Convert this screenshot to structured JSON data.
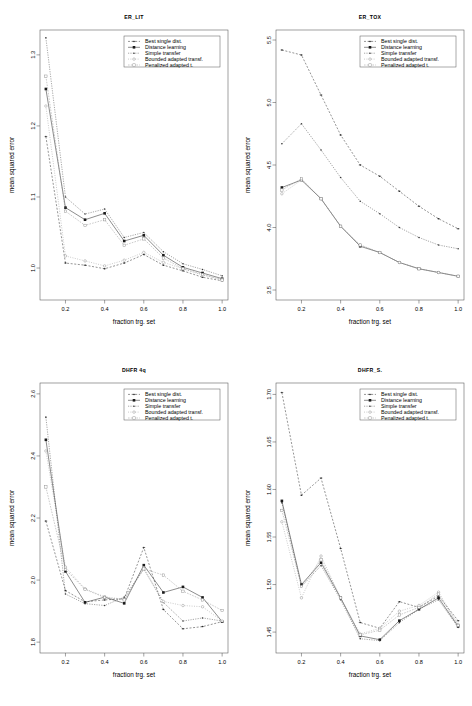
{
  "figure": {
    "name": "four-panel-mse-vs-fraction-training-set",
    "panel_count": 4
  },
  "common": {
    "xlabel": "fraction trg. set",
    "ylabel": "mean squared error",
    "xticks": [
      "0.2",
      "0.4",
      "0.6",
      "0.8",
      "1.0"
    ],
    "xtick_values": [
      0.2,
      0.4,
      0.6,
      0.8,
      1.0
    ],
    "xlim": [
      0.07,
      1.03
    ],
    "legend_labels": [
      "Best single dist.",
      "Distance learning",
      "Simple transfer",
      "Bounded adapted transf.",
      "Penalized adapted t."
    ],
    "legend_markers": [
      "dot-cross",
      "filled-square",
      "dot-small",
      "open-circle",
      "open-square"
    ],
    "legend_position": "top-right inside plot",
    "grid": false
  },
  "chart_data": [
    {
      "type": "line",
      "title": "ER_LIT",
      "xlabel": "fraction trg. set",
      "ylabel": "mean squared error",
      "x": [
        0.1,
        0.2,
        0.3,
        0.4,
        0.5,
        0.6,
        0.7,
        0.8,
        0.9,
        1.0
      ],
      "xlim": [
        0.07,
        1.03
      ],
      "ylim": [
        0.955,
        1.335
      ],
      "yticks": [
        "1.0",
        "1.1",
        "1.2",
        "1.3"
      ],
      "ytick_values": [
        1.0,
        1.1,
        1.2,
        1.3
      ],
      "series": [
        {
          "name": "Best single dist.",
          "values": [
            1.185,
            1.007,
            1.004,
            0.999,
            1.007,
            1.019,
            1.004,
            0.996,
            0.987,
            0.982
          ]
        },
        {
          "name": "Distance learning",
          "values": [
            1.252,
            1.085,
            1.068,
            1.077,
            1.038,
            1.046,
            1.018,
            1.001,
            0.993,
            0.985
          ]
        },
        {
          "name": "Simple transfer",
          "values": [
            1.324,
            1.1,
            1.076,
            1.083,
            1.043,
            1.05,
            1.023,
            1.006,
            0.998,
            0.989
          ]
        },
        {
          "name": "Bounded adapted transf.",
          "values": [
            1.228,
            1.017,
            1.01,
            1.003,
            1.011,
            1.022,
            1.008,
            0.999,
            0.99,
            0.984
          ]
        },
        {
          "name": "Penalized adapted t.",
          "values": [
            1.27,
            1.08,
            1.06,
            1.068,
            1.032,
            1.041,
            1.014,
            0.999,
            0.991,
            0.983
          ]
        }
      ]
    },
    {
      "type": "line",
      "title": "ER_TOX",
      "xlabel": "fraction trg. set",
      "ylabel": "mean squared error",
      "x": [
        0.1,
        0.2,
        0.3,
        0.4,
        0.5,
        0.6,
        0.7,
        0.8,
        0.9,
        1.0
      ],
      "xlim": [
        0.07,
        1.03
      ],
      "ylim": [
        3.42,
        5.58
      ],
      "yticks": [
        "3.5",
        "4.0",
        "4.5",
        "5.0",
        "5.5"
      ],
      "ytick_values": [
        3.5,
        4.0,
        4.5,
        5.0,
        5.5
      ],
      "series": [
        {
          "name": "Best single dist.",
          "values": [
            5.42,
            5.38,
            5.06,
            4.74,
            4.5,
            4.41,
            4.29,
            4.17,
            4.07,
            3.99
          ]
        },
        {
          "name": "Distance learning",
          "values": [
            4.32,
            4.38,
            4.23,
            4.01,
            3.85,
            3.8,
            3.72,
            3.67,
            3.64,
            3.61
          ]
        },
        {
          "name": "Simple transfer",
          "values": [
            4.67,
            4.83,
            4.62,
            4.4,
            4.21,
            4.11,
            4.0,
            3.92,
            3.86,
            3.83
          ]
        },
        {
          "name": "Bounded adapted transf.",
          "values": [
            4.27,
            4.38,
            4.23,
            4.01,
            3.86,
            3.8,
            3.72,
            3.67,
            3.64,
            3.61
          ]
        },
        {
          "name": "Penalized adapted t.",
          "values": [
            4.3,
            4.39,
            4.23,
            4.01,
            3.86,
            3.8,
            3.72,
            3.67,
            3.64,
            3.61
          ]
        }
      ]
    },
    {
      "type": "line",
      "title": "DHFR 4q",
      "xlabel": "fraction trg. set",
      "ylabel": "mean squared error",
      "x": [
        0.1,
        0.2,
        0.3,
        0.4,
        0.5,
        0.6,
        0.7,
        0.8,
        0.9,
        1.0
      ],
      "xlim": [
        0.07,
        1.03
      ],
      "ylim": [
        1.765,
        2.635
      ],
      "yticks": [
        "1.8",
        "2.0",
        "2.2",
        "2.4",
        "2.6"
      ],
      "ytick_values": [
        1.8,
        2.0,
        2.2,
        2.4,
        2.6
      ],
      "series": [
        {
          "name": "Best single dist.",
          "values": [
            2.19,
            1.966,
            1.93,
            1.936,
            1.94,
            2.105,
            1.905,
            1.843,
            1.85,
            1.866
          ]
        },
        {
          "name": "Distance learning",
          "values": [
            2.452,
            2.028,
            1.928,
            1.945,
            1.925,
            2.048,
            1.96,
            1.978,
            1.944,
            1.866
          ]
        },
        {
          "name": "Simple transfer",
          "values": [
            2.525,
            1.955,
            1.924,
            1.918,
            1.945,
            2.035,
            1.928,
            1.868,
            1.878,
            1.868
          ]
        },
        {
          "name": "Bounded adapted transf.",
          "values": [
            2.416,
            2.042,
            1.972,
            1.946,
            1.938,
            2.04,
            1.931,
            1.918,
            1.914,
            1.868
          ]
        },
        {
          "name": "Penalized adapted t.",
          "values": [
            2.3,
            2.034,
            1.97,
            1.944,
            1.936,
            2.036,
            2.016,
            1.964,
            1.936,
            1.902
          ]
        }
      ]
    },
    {
      "type": "line",
      "title": "DHFR_S.",
      "xlabel": "fraction trg. set",
      "ylabel": "mean squared error",
      "x": [
        0.1,
        0.2,
        0.3,
        0.4,
        0.5,
        0.6,
        0.7,
        0.8,
        0.9,
        1.0
      ],
      "xlim": [
        0.07,
        1.03
      ],
      "ylim": [
        1.428,
        1.712
      ],
      "yticks": [
        "1.45",
        "1.50",
        "1.55",
        "1.60",
        "1.65",
        "1.70"
      ],
      "ytick_values": [
        1.45,
        1.5,
        1.55,
        1.6,
        1.65,
        1.7
      ],
      "series": [
        {
          "name": "Best single dist.",
          "values": [
            1.702,
            1.594,
            1.612,
            1.538,
            1.46,
            1.454,
            1.482,
            1.476,
            1.488,
            1.462
          ]
        },
        {
          "name": "Distance learning",
          "values": [
            1.588,
            1.5,
            1.523,
            1.486,
            1.446,
            1.442,
            1.462,
            1.474,
            1.486,
            1.456
          ]
        },
        {
          "name": "Simple transfer",
          "values": [
            1.586,
            1.498,
            1.52,
            1.484,
            1.443,
            1.441,
            1.46,
            1.474,
            1.484,
            1.455
          ]
        },
        {
          "name": "Bounded adapted transf.",
          "values": [
            1.566,
            1.486,
            1.53,
            1.486,
            1.448,
            1.454,
            1.472,
            1.478,
            1.492,
            1.458
          ]
        },
        {
          "name": "Penalized adapted t.",
          "values": [
            1.578,
            1.498,
            1.526,
            1.486,
            1.447,
            1.452,
            1.468,
            1.476,
            1.49,
            1.457
          ]
        }
      ]
    }
  ]
}
